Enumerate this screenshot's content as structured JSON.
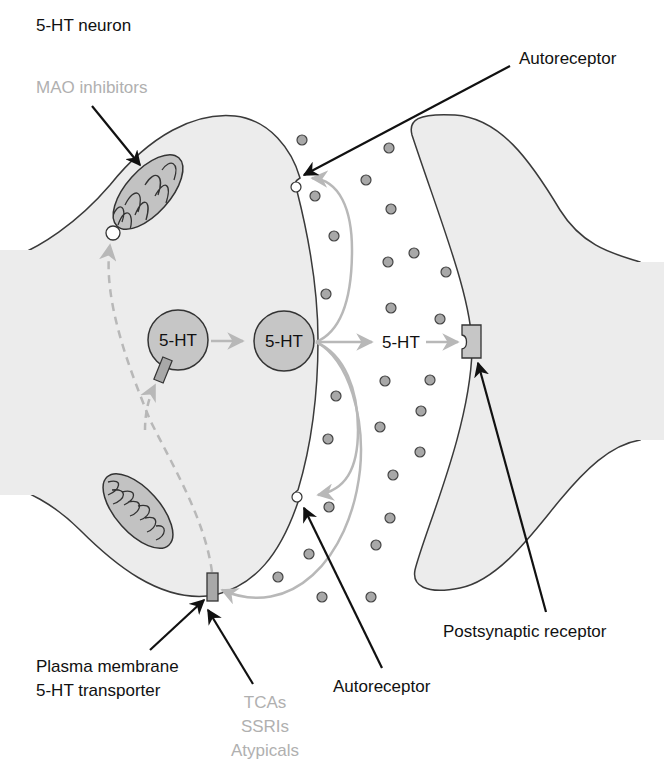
{
  "title": "5-HT neuron",
  "labels": {
    "mao_inhibitors": "MAO inhibitors",
    "autoreceptor_top": "Autoreceptor",
    "autoreceptor_bottom": "Autoreceptor",
    "postsynaptic_receptor": "Postsynaptic receptor",
    "transporter_line1": "Plasma membrane",
    "transporter_line2": "5-HT transporter",
    "drug_line1": "TCAs",
    "drug_line2": "SSRIs",
    "drug_line3": "Atypicals"
  },
  "vesicles": {
    "vesicle_loading": "5-HT",
    "vesicle_docked": "5-HT",
    "released": "5-HT"
  },
  "colors": {
    "cell_fill": "#ececec",
    "outline": "#333333",
    "vesicle_fill": "#c6c6c6",
    "molecule_fill": "#a8a8a8",
    "gray_path": "#b8b8b8",
    "drug_text": "#b0b0b0",
    "arrow_black": "#111111"
  }
}
